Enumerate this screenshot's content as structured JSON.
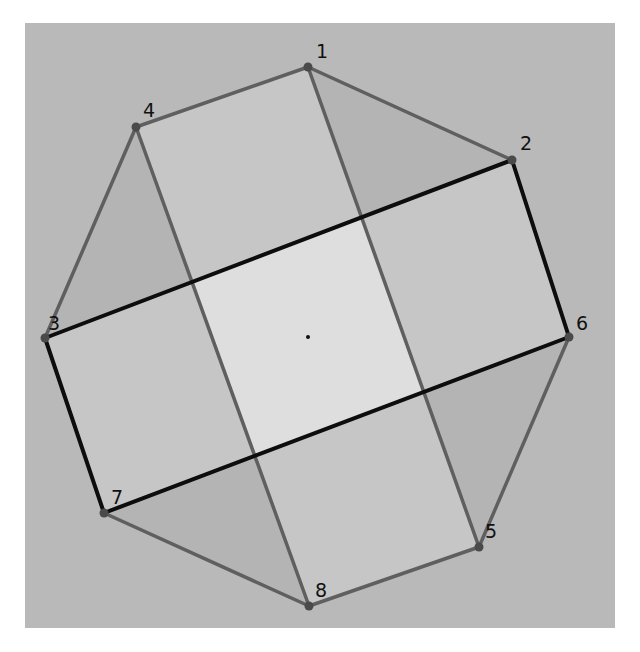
{
  "frame": {
    "x": 25,
    "y": 23,
    "width": 590,
    "height": 605,
    "background": "#b9b9b9"
  },
  "colors": {
    "octagon_fill": "#b4b4b4",
    "rect_fill": "#c6c6c6",
    "overlap_fill": "#dedede",
    "gray_edge": "#5f5f5f",
    "black_edge": "#0d0d0d",
    "vertex": "#4a4a4a"
  },
  "vertices": [
    {
      "id": "1",
      "label": "1",
      "x": 308,
      "y": 67,
      "lx": 316,
      "ly": 58
    },
    {
      "id": "2",
      "label": "2",
      "x": 512,
      "y": 160,
      "lx": 520,
      "ly": 150
    },
    {
      "id": "3",
      "label": "3",
      "x": 45,
      "y": 338,
      "lx": 48,
      "ly": 330
    },
    {
      "id": "4",
      "label": "4",
      "x": 136,
      "y": 127,
      "lx": 143,
      "ly": 117
    },
    {
      "id": "5",
      "label": "5",
      "x": 479,
      "y": 547,
      "lx": 485,
      "ly": 538
    },
    {
      "id": "6",
      "label": "6",
      "x": 569,
      "y": 337,
      "lx": 576,
      "ly": 330
    },
    {
      "id": "7",
      "label": "7",
      "x": 104,
      "y": 513,
      "lx": 111,
      "ly": 504
    },
    {
      "id": "8",
      "label": "8",
      "x": 309,
      "y": 606,
      "lx": 315,
      "ly": 597
    }
  ],
  "center": {
    "x": 308,
    "y": 337
  },
  "octagon_order": [
    "1",
    "2",
    "6",
    "5",
    "8",
    "7",
    "3",
    "4"
  ],
  "rect_gray": [
    "4",
    "1",
    "5",
    "8"
  ],
  "rect_black": [
    "3",
    "2",
    "6",
    "7"
  ],
  "edges": [
    {
      "from": "1",
      "to": "2",
      "style": "gray"
    },
    {
      "from": "6",
      "to": "5",
      "style": "gray"
    },
    {
      "from": "5",
      "to": "8",
      "style": "gray"
    },
    {
      "from": "8",
      "to": "7",
      "style": "gray"
    },
    {
      "from": "3",
      "to": "4",
      "style": "gray"
    },
    {
      "from": "4",
      "to": "1",
      "style": "gray"
    },
    {
      "from": "1",
      "to": "5",
      "style": "gray"
    },
    {
      "from": "4",
      "to": "8",
      "style": "gray"
    },
    {
      "from": "3",
      "to": "2",
      "style": "black"
    },
    {
      "from": "2",
      "to": "6",
      "style": "black"
    },
    {
      "from": "6",
      "to": "7",
      "style": "black"
    },
    {
      "from": "7",
      "to": "3",
      "style": "black"
    }
  ]
}
